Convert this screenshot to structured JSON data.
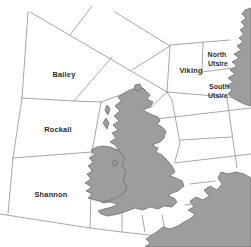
{
  "window": {
    "width_px": 251,
    "height_px": 247
  },
  "map": {
    "description_labels_visible": [
      "Bailey",
      "Rockall",
      "Shannon",
      "Viking",
      "North Utsire",
      "South Utsire"
    ],
    "colors": {
      "sea": "#ffffff",
      "land": "#9d9d9d",
      "coast_outline": "#6f6f6f",
      "boundary_line": "#8f8f8f",
      "label_text": "#2b2b2b"
    },
    "sea_area_labels": [
      {
        "id": "bailey",
        "label": "Bailey"
      },
      {
        "id": "rockall",
        "label": "Rockall"
      },
      {
        "id": "shannon",
        "label": "Shannon"
      },
      {
        "id": "viking",
        "label": "Viking"
      },
      {
        "id": "north-utsire",
        "label": "North Utsire",
        "line1": "North",
        "line2": "Utsire"
      },
      {
        "id": "south-utsire",
        "label": "South Utsire",
        "line1": "South",
        "line2": "Utsire"
      }
    ]
  }
}
